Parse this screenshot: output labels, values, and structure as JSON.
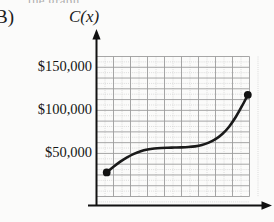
{
  "figure": {
    "part_label": "B)",
    "top_clipped_text": "the graph",
    "function_label": "C(x)"
  },
  "chart_data": {
    "type": "line",
    "title": "",
    "subtitle": "",
    "xlabel": "",
    "ylabel": "C(x)",
    "ylim": [
      0,
      162500
    ],
    "xlim": [
      0,
      9
    ],
    "grid": true,
    "grid_major_columns": 9,
    "grid_major_rows": 13,
    "grid_minor": true,
    "legend": null,
    "y_tick_labels": [
      "$150,000",
      "$100,000",
      "$50,000"
    ],
    "y_tick_values": [
      150000,
      100000,
      50000
    ],
    "x_tick_labels": [],
    "axis_arrows": [
      "up",
      "right"
    ],
    "endpoint_markers": [
      "filled-dot",
      "filled-dot"
    ],
    "curve_shape": "sigmoid",
    "x": [
      0.6,
      1.0,
      1.4,
      1.8,
      2.2,
      2.6,
      3.0,
      3.4,
      3.8,
      4.2,
      4.6,
      5.0,
      5.4,
      5.8,
      6.2,
      6.6,
      7.0,
      7.4,
      7.8,
      8.2,
      8.6,
      8.9
    ],
    "values": [
      28000,
      34500,
      40500,
      45500,
      49500,
      52500,
      54500,
      55700,
      56300,
      56600,
      56800,
      57000,
      57400,
      58200,
      59800,
      62500,
      66500,
      72500,
      81000,
      92500,
      106500,
      118000
    ],
    "annotations": [
      {
        "label": "start point",
        "x": 0.6,
        "y": 28000
      },
      {
        "label": "end point",
        "x": 8.9,
        "y": 118000
      }
    ],
    "colors": {
      "curve": "#1a1a1a",
      "axis": "#111111",
      "grid_major": "#9c9c9c",
      "grid_minor": "#cfcfcf",
      "background": "#fbfbfa",
      "text": "#151515"
    }
  }
}
